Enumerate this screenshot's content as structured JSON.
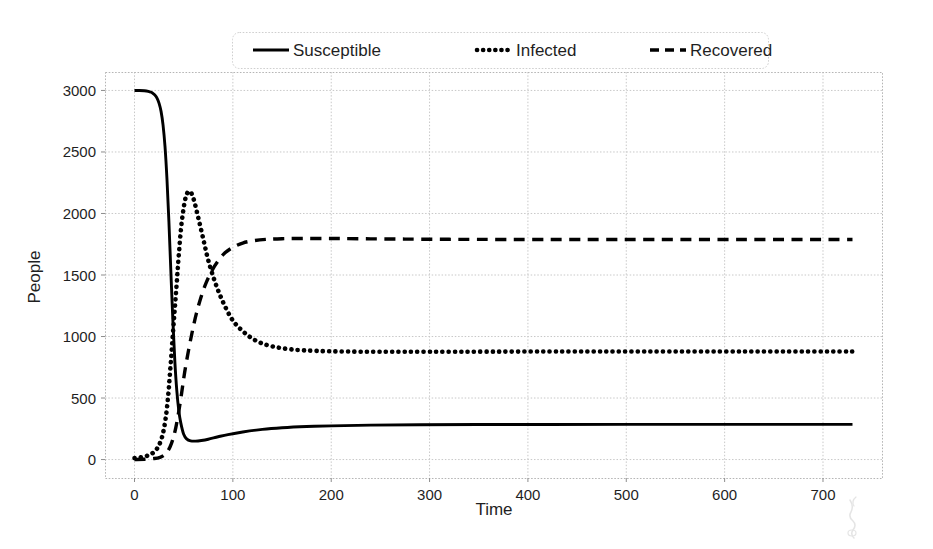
{
  "chart_data": {
    "type": "line",
    "title": "",
    "xlabel": "Time",
    "ylabel": "People",
    "xlim": [
      -30,
      760
    ],
    "ylim": [
      -150,
      3150
    ],
    "xticks": [
      0,
      100,
      200,
      300,
      400,
      500,
      600,
      700
    ],
    "yticks": [
      0,
      500,
      1000,
      1500,
      2000,
      2500,
      3000
    ],
    "grid": true,
    "legend_position": "above-center",
    "series": [
      {
        "name": "Susceptible",
        "linestyle": "solid",
        "color": "#000000",
        "x": [
          0,
          5,
          10,
          14,
          17,
          19,
          21,
          23,
          25,
          27,
          29,
          31,
          33,
          35,
          37,
          39,
          41,
          43,
          45,
          47,
          50,
          53,
          57,
          62,
          68,
          75,
          85,
          95,
          110,
          130,
          150,
          175,
          200,
          240,
          290,
          350,
          420,
          500,
          600,
          700,
          730
        ],
        "y": [
          3000,
          3000,
          2998,
          2993,
          2985,
          2975,
          2960,
          2935,
          2895,
          2830,
          2720,
          2545,
          2280,
          1930,
          1520,
          1130,
          800,
          560,
          400,
          300,
          205,
          168,
          152,
          150,
          155,
          165,
          185,
          203,
          224,
          245,
          258,
          268,
          274,
          280,
          283,
          285,
          285,
          286,
          286,
          286,
          286
        ]
      },
      {
        "name": "Infected",
        "linestyle": "dotted",
        "color": "#000000",
        "x": [
          0,
          5,
          10,
          14,
          17,
          19,
          21,
          23,
          25,
          27,
          29,
          31,
          33,
          35,
          37,
          39,
          41,
          43,
          45,
          48,
          52,
          56,
          60,
          65,
          70,
          75,
          82,
          90,
          100,
          112,
          125,
          140,
          160,
          185,
          215,
          250,
          300,
          360,
          430,
          520,
          620,
          700,
          730
        ],
        "y": [
          12,
          16,
          24,
          34,
          45,
          56,
          70,
          90,
          118,
          158,
          215,
          300,
          420,
          590,
          800,
          1020,
          1230,
          1440,
          1660,
          1930,
          2130,
          2180,
          2120,
          1960,
          1790,
          1620,
          1440,
          1280,
          1130,
          1030,
          960,
          920,
          895,
          883,
          878,
          876,
          876,
          877,
          878,
          878,
          878,
          878,
          878
        ]
      },
      {
        "name": "Recovered",
        "linestyle": "dashed",
        "color": "#000000",
        "x": [
          0,
          10,
          20,
          26,
          30,
          33,
          36,
          39,
          42,
          45,
          48,
          51,
          55,
          59,
          63,
          68,
          73,
          79,
          85,
          92,
          100,
          110,
          122,
          135,
          150,
          168,
          188,
          210,
          240,
          275,
          320,
          380,
          450,
          530,
          620,
          700,
          730
        ],
        "y": [
          0,
          2,
          8,
          18,
          35,
          60,
          100,
          165,
          260,
          390,
          545,
          710,
          890,
          1050,
          1190,
          1330,
          1440,
          1540,
          1615,
          1680,
          1725,
          1760,
          1780,
          1790,
          1795,
          1797,
          1797,
          1796,
          1794,
          1792,
          1790,
          1789,
          1789,
          1789,
          1789,
          1789,
          1789
        ]
      }
    ],
    "annotations": {
      "infected_peak": {
        "x": 56,
        "y": 2180
      },
      "susceptible_min": {
        "x": 62,
        "y": 150
      },
      "crossover_infected_recovered": {
        "x": 72,
        "y": 1470
      }
    }
  },
  "legend": {
    "items": [
      {
        "label": "Susceptible",
        "style": "solid"
      },
      {
        "label": "Infected",
        "style": "dotted"
      },
      {
        "label": "Recovered",
        "style": "dashed"
      }
    ]
  },
  "axes": {
    "x_title": "Time",
    "y_title": "People",
    "x_tick_labels": [
      "0",
      "100",
      "200",
      "300",
      "400",
      "500",
      "600",
      "700"
    ],
    "y_tick_labels": [
      "0",
      "500",
      "1000",
      "1500",
      "2000",
      "2500",
      "3000"
    ]
  },
  "colors": {
    "line": "#000000",
    "grid": "#c8c8c8",
    "frame": "#b5b5b5",
    "background": "#ffffff",
    "text": "#1f1f1f"
  }
}
